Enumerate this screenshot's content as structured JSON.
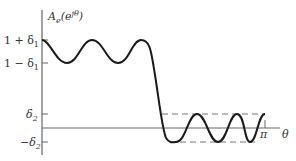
{
  "diagram": {
    "type": "filter-tolerance-response",
    "y_axis_label": {
      "main": "A",
      "sub": "e",
      "paren_open": "(e",
      "sup": "jθ",
      "paren_close": ")"
    },
    "x_axis_label": "θ",
    "x_end_label": "π",
    "y_ticks": [
      {
        "label_main": "1 + δ",
        "label_sub": "1",
        "y": 40
      },
      {
        "label_main": "1 − δ",
        "label_sub": "1",
        "y": 63
      },
      {
        "label_main": "δ",
        "label_sub": "2",
        "y": 114
      },
      {
        "label_main": "−δ",
        "label_sub": "2",
        "y": 142
      }
    ],
    "colors": {
      "curve": "#1a1a1a",
      "axis": "#555555",
      "dash": "#666666",
      "text": "#333333"
    }
  }
}
